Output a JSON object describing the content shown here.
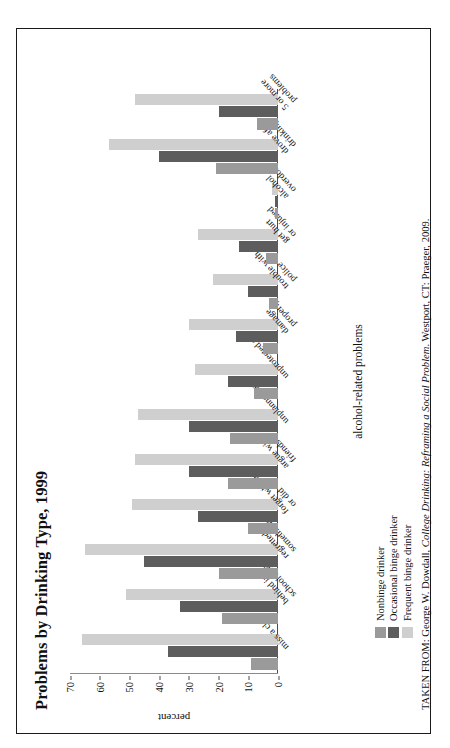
{
  "figure": {
    "title": "Problems by Drinking Type, 1999",
    "source_note_prefix": "TAKEN FROM: George W. Dowdall, ",
    "source_note_italic": "College Drinking: Reframing a Social Problem",
    "source_note_suffix": ". Westport, CT: Praeger, 2009."
  },
  "legend": {
    "position": "bottom-left",
    "items": [
      {
        "label": "Nonbinge drinker",
        "color": "#9a9a9a"
      },
      {
        "label": "Occasional binge drinker",
        "color": "#5d5d5d"
      },
      {
        "label": "Frequent binge drinker",
        "color": "#cfcfcf"
      }
    ]
  },
  "axes": {
    "y_label": "percent",
    "x_label": "alcohol-related problems",
    "y_ticks": [
      "70",
      "60",
      "50",
      "40",
      "30",
      "20",
      "10",
      "0"
    ]
  },
  "chart_data": {
    "type": "bar",
    "title": "Problems by Drinking Type, 1999",
    "xlabel": "alcohol-related problems",
    "ylabel": "percent",
    "ylim": [
      0,
      70
    ],
    "grid": false,
    "legend_position": "bottom-left",
    "categories": [
      "miss a class",
      "behind in schoolwork",
      "regretted something",
      "forget where or did",
      "argue with friends",
      "unplanned sex",
      "unprotected sex",
      "damage property",
      "trouble with police",
      "get hurt or injured",
      "alcohol overdose",
      "drove after drinking",
      "5 or more problems"
    ],
    "category_lines": [
      [
        "miss a class"
      ],
      [
        "behind in",
        "schoolwork"
      ],
      [
        "regretted",
        "something"
      ],
      [
        "forget where",
        "or did"
      ],
      [
        "argue with",
        "friends"
      ],
      [
        "unplanned sex"
      ],
      [
        "unprotected sex"
      ],
      [
        "damage",
        "property"
      ],
      [
        "trouble with",
        "police"
      ],
      [
        "get hurt",
        "or injured"
      ],
      [
        "alcohol",
        "overdose"
      ],
      [
        "drove after",
        "drinking"
      ],
      [
        "5 or more",
        "problems"
      ]
    ],
    "series": [
      {
        "name": "Nonbinge drinker",
        "color": "#9a9a9a",
        "values": [
          9,
          19,
          20,
          10,
          17,
          16,
          8,
          5,
          3,
          4,
          1,
          21,
          7
        ]
      },
      {
        "name": "Occasional binge drinker",
        "color": "#5d5d5d",
        "values": [
          37,
          33,
          45,
          27,
          30,
          30,
          17,
          14,
          10,
          13,
          1,
          40,
          20
        ]
      },
      {
        "name": "Frequent binge drinker",
        "color": "#cfcfcf",
        "values": [
          66,
          51,
          65,
          49,
          48,
          47,
          28,
          30,
          22,
          27,
          2,
          57,
          48
        ]
      }
    ]
  }
}
